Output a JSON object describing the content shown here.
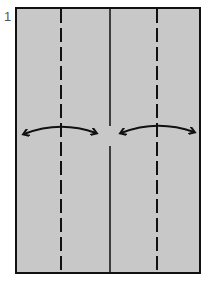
{
  "diagram": {
    "step_number": "1",
    "paper_color": "#c8c8c8",
    "line_color": "#111111",
    "paper": {
      "x": 16,
      "y": 8,
      "width": 184,
      "height": 265
    },
    "valley_folds": [
      {
        "name": "left-valley-fold",
        "x": 61
      },
      {
        "name": "right-valley-fold",
        "x": 157
      }
    ],
    "center_crease": {
      "x": 110
    },
    "arrows": [
      {
        "name": "left-fold-arrow",
        "from_x": 23,
        "to_x": 96,
        "y": 131
      },
      {
        "name": "right-fold-arrow",
        "from_x": 120,
        "to_x": 195,
        "y": 131
      }
    ]
  }
}
